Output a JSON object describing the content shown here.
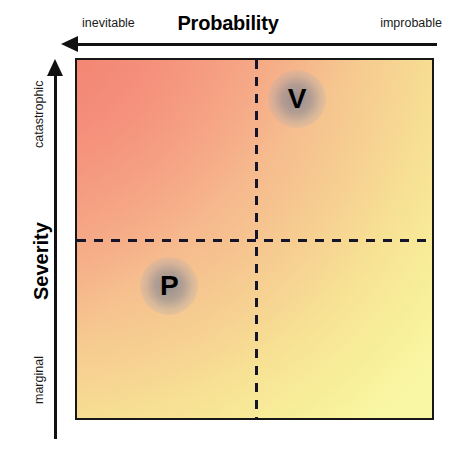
{
  "chart_data": {
    "type": "scatter",
    "xlabel": "Probability",
    "ylabel": "Severity",
    "x_axis": {
      "title": "Probability",
      "left_label": "inevitable",
      "right_label": "improbable",
      "direction": "decreasing-to-the-right",
      "arrow": "left"
    },
    "y_axis": {
      "title": "Severity",
      "top_label": "catastrophic",
      "bottom_label": "marginal",
      "direction": "increasing-upward",
      "arrow": "up"
    },
    "grid": "quadrant-dividers",
    "legend": "none",
    "quadrant_divider_x_fraction": 0.5,
    "quadrant_divider_y_fraction": 0.5,
    "gradient": {
      "high_risk_corner": "top-left",
      "low_risk_corner": "bottom-right",
      "top_left_color": "#f2907f",
      "top_right_color": "#f5cf86",
      "bottom_left_color": "#f2d285",
      "bottom_right_color": "#f7f49a"
    },
    "points": [
      {
        "label": "V",
        "x_fraction": 0.62,
        "y_fraction": 0.89,
        "probability": "improbable",
        "severity": "catastrophic",
        "quadrant": "top-right"
      },
      {
        "label": "P",
        "x_fraction": 0.26,
        "y_fraction": 0.37,
        "probability": "inevitable",
        "severity": "marginal",
        "quadrant": "bottom-left"
      }
    ]
  }
}
